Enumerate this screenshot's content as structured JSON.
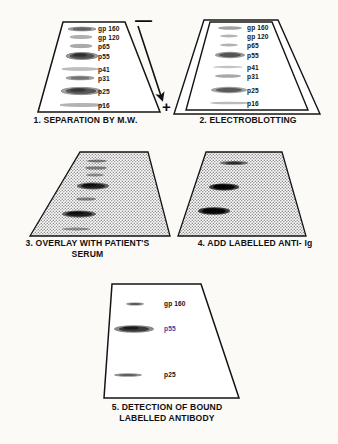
{
  "figure": {
    "background_color": "#fbfaf7",
    "line_color": "#111111",
    "accent_blue": "#3b3fa0"
  },
  "panels": [
    {
      "id": "panel-1",
      "number": "1.",
      "caption": "1.  SEPARATION BY M.W.",
      "style": "plain-gel",
      "shading": "none",
      "bands": [
        {
          "label": "gp 160",
          "y": 0.07,
          "intensity": "light",
          "width": 0.52
        },
        {
          "label": "gp 120",
          "y": 0.155,
          "intensity": "light",
          "width": 0.4
        },
        {
          "label": "p65",
          "y": 0.245,
          "intensity": "light",
          "width": 0.4
        },
        {
          "label": "p55",
          "y": 0.345,
          "intensity": "medium",
          "width": 0.52
        },
        {
          "label": "p41",
          "y": 0.475,
          "intensity": "light",
          "width": 0.58
        },
        {
          "label": "p31",
          "y": 0.565,
          "intensity": "light",
          "width": 0.5
        },
        {
          "label": "p25",
          "y": 0.695,
          "intensity": "medium",
          "width": 0.62
        },
        {
          "label": "p16",
          "y": 0.855,
          "intensity": "light",
          "width": 0.7
        }
      ]
    },
    {
      "id": "panel-2",
      "number": "2.",
      "caption": "2.  ELECTROBLOTTING",
      "style": "double-outline-gel",
      "shading": "none",
      "bands": [
        {
          "label": "gp 160",
          "y": 0.07,
          "intensity": "light",
          "width": 0.44
        },
        {
          "label": "gp 120",
          "y": 0.155,
          "intensity": "light",
          "width": 0.36
        },
        {
          "label": "p65",
          "y": 0.245,
          "intensity": "light",
          "width": 0.36
        },
        {
          "label": "p55",
          "y": 0.345,
          "intensity": "medium",
          "width": 0.52
        },
        {
          "label": "p41",
          "y": 0.475,
          "intensity": "light",
          "width": 0.52
        },
        {
          "label": "p31",
          "y": 0.565,
          "intensity": "light",
          "width": 0.48
        },
        {
          "label": "p25",
          "y": 0.695,
          "intensity": "medium",
          "width": 0.6
        },
        {
          "label": "p16",
          "y": 0.855,
          "intensity": "light",
          "width": 0.66
        }
      ]
    },
    {
      "id": "panel-3",
      "number": "3.",
      "caption": "3.  OVERLAY WITH PATIENT'S\nSERUM",
      "style": "stippled-gel",
      "shading": "stipple",
      "bands": [
        {
          "label": "",
          "y": 0.09,
          "intensity": "light",
          "width": 0.3
        },
        {
          "label": "",
          "y": 0.165,
          "intensity": "light",
          "width": 0.34
        },
        {
          "label": "",
          "y": 0.235,
          "intensity": "light",
          "width": 0.28
        },
        {
          "label": "",
          "y": 0.345,
          "intensity": "dark",
          "width": 0.44
        },
        {
          "label": "",
          "y": 0.495,
          "intensity": "light",
          "width": 0.3
        },
        {
          "label": "",
          "y": 0.645,
          "intensity": "dark",
          "width": 0.46
        },
        {
          "label": "",
          "y": 0.815,
          "intensity": "light",
          "width": 0.4
        }
      ]
    },
    {
      "id": "panel-4",
      "number": "4.",
      "caption": "4.  ADD LABELLED ANTI- Ig",
      "style": "stippled-gel",
      "shading": "stipple",
      "bands": [
        {
          "label": "",
          "y": 0.11,
          "intensity": "medium",
          "width": 0.34
        },
        {
          "label": "",
          "y": 0.38,
          "intensity": "dark",
          "width": 0.36
        },
        {
          "label": "",
          "y": 0.66,
          "intensity": "dark",
          "width": 0.38
        }
      ]
    },
    {
      "id": "panel-5",
      "number": "5.",
      "caption": "5.  DETECTION OF BOUND\nLABELLED ANTIBODY",
      "style": "plain-gel",
      "shading": "none",
      "bands": [
        {
          "label": "gp 160",
          "y": 0.17,
          "intensity": "light",
          "width": 0.26,
          "label_color": "dark"
        },
        {
          "label": "p55",
          "y": 0.39,
          "intensity": "dark",
          "width": 0.46,
          "label_color": "blue"
        },
        {
          "label": "p25",
          "y": 0.77,
          "intensity": "light",
          "width": 0.36,
          "label_color": "dark"
        }
      ]
    }
  ],
  "electrophoresis": {
    "negative_symbol": "—",
    "positive_symbol": "+",
    "arrow_direction": "downward",
    "description": "migration arrow from negative to positive electrode"
  }
}
